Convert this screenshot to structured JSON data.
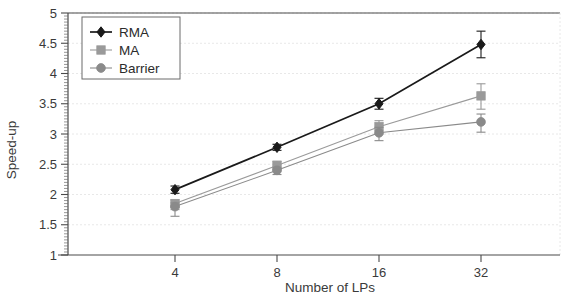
{
  "chart_data": {
    "type": "line",
    "title": "",
    "xlabel": "Number of LPs",
    "ylabel": "Speed-up",
    "categories": [
      "4",
      "8",
      "16",
      "32"
    ],
    "x": [
      4,
      8,
      16,
      32
    ],
    "xtick_labels": [
      "4",
      "8",
      "16",
      "32"
    ],
    "ytick_labels": [
      "1",
      "1.5",
      "2",
      "2.5",
      "3",
      "3.5",
      "4",
      "4.5",
      "5"
    ],
    "yticks": [
      1,
      1.5,
      2,
      2.5,
      3,
      3.5,
      4,
      4.5,
      5
    ],
    "ylim": [
      1,
      5
    ],
    "grid": true,
    "minor_ticks": true,
    "legend_position": "top-left",
    "series": [
      {
        "name": "RMA",
        "marker": "diamond",
        "color": "#1a1a1a",
        "values": [
          2.08,
          2.78,
          3.5,
          4.48
        ],
        "err_low": [
          0.06,
          0.05,
          0.09,
          0.22
        ],
        "err_high": [
          0.06,
          0.05,
          0.09,
          0.22
        ]
      },
      {
        "name": "MA",
        "marker": "square",
        "color": "#9a9a9a",
        "values": [
          1.85,
          2.48,
          3.12,
          3.63
        ],
        "err_low": [
          0.1,
          0.09,
          0.12,
          0.22
        ],
        "err_high": [
          0.06,
          0.07,
          0.1,
          0.2
        ]
      },
      {
        "name": "Barrier",
        "marker": "circle",
        "color": "#8a8a8a",
        "values": [
          1.8,
          2.4,
          3.02,
          3.2
        ],
        "err_low": [
          0.16,
          0.07,
          0.13,
          0.17
        ],
        "err_high": [
          0.06,
          0.05,
          0.09,
          0.13
        ]
      }
    ]
  },
  "legend": {
    "entries": [
      {
        "label": "RMA"
      },
      {
        "label": "MA"
      },
      {
        "label": "Barrier"
      }
    ]
  },
  "colors": {
    "rma": "#1a1a1a",
    "ma": "#9a9a9a",
    "barrier": "#8a8a8a",
    "grid": "#e2e2e2",
    "axis": "#4a4a4a",
    "background": "#ffffff"
  }
}
